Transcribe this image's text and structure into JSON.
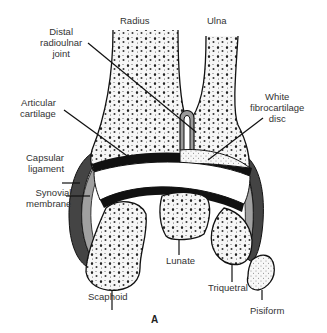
{
  "figure": {
    "panel_label": "A",
    "labels": {
      "radius": "Radius",
      "ulna": "Ulna",
      "distal_radioulnar_joint": "Distal\nradioulnar\njoint",
      "white_fibrocartilage_disc": "White\nfibrocartilage\ndisc",
      "articular_cartilage": "Articular\ncartilage",
      "capsular_ligament": "Capsular\nligament",
      "synovial_membrane": "Synovial\nmembrane",
      "lunate": "Lunate",
      "scaphoid": "Scaphoid",
      "triquetral": "Triquetral",
      "pisiform": "Pisiform"
    },
    "colors": {
      "ink": "#111111",
      "capsule": "#444444",
      "synovial": "#9a9a9a",
      "bone_fill": "#f4f4f4",
      "background": "#ffffff"
    }
  }
}
